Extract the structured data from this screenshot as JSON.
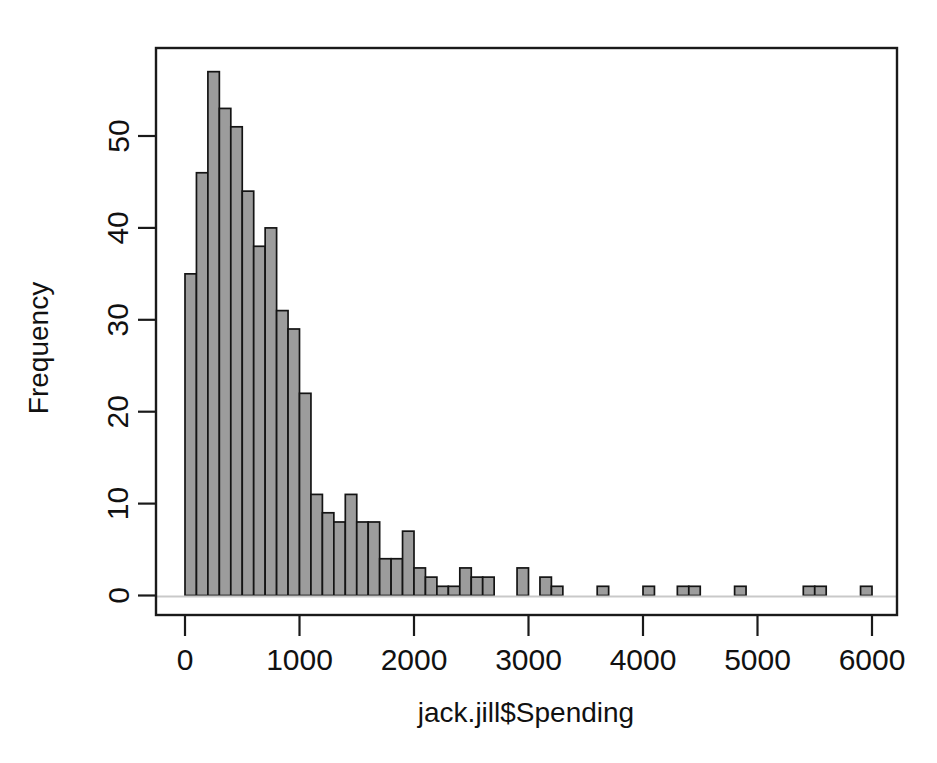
{
  "figure": {
    "type": "histogram-plot",
    "background_color": "#ffffff",
    "bar_fill_color": "#9c9c9c",
    "bar_border_color": "#141414",
    "axis_color": "#1a1a1a"
  },
  "chart_data": {
    "type": "bar",
    "title": "",
    "xlabel": "jack.jill$Spending",
    "ylabel": "Frequency",
    "xlim": [
      -60,
      6320
    ],
    "ylim": [
      0,
      59.5
    ],
    "grid": false,
    "legend": null,
    "bin_width": 100,
    "xticks": [
      0,
      1000,
      2000,
      3000,
      4000,
      5000,
      6000
    ],
    "xtick_labels": [
      "0",
      "1000",
      "2000",
      "3000",
      "4000",
      "5000",
      "6000"
    ],
    "yticks": [
      0,
      10,
      20,
      30,
      40,
      50
    ],
    "ytick_labels": [
      "0",
      "10",
      "20",
      "30",
      "40",
      "50"
    ],
    "bin_starts": [
      0,
      100,
      200,
      300,
      400,
      500,
      600,
      700,
      800,
      900,
      1000,
      1100,
      1200,
      1300,
      1400,
      1500,
      1600,
      1700,
      1800,
      1900,
      2000,
      2100,
      2200,
      2300,
      2400,
      2500,
      2600,
      2700,
      2800,
      2900,
      3000,
      3100,
      3200,
      3300,
      3400,
      3500,
      3600,
      3700,
      3800,
      3900,
      4000,
      4100,
      4200,
      4300,
      4400,
      4500,
      4600,
      4700,
      4800,
      4900,
      5000,
      5100,
      5200,
      5300,
      5400,
      5500,
      5600,
      5700,
      5800,
      5900
    ],
    "categories": [
      "0-100",
      "100-200",
      "200-300",
      "300-400",
      "400-500",
      "500-600",
      "600-700",
      "700-800",
      "800-900",
      "900-1000",
      "1000-1100",
      "1100-1200",
      "1200-1300",
      "1300-1400",
      "1400-1500",
      "1500-1600",
      "1600-1700",
      "1700-1800",
      "1800-1900",
      "1900-2000",
      "2000-2100",
      "2100-2200",
      "2200-2300",
      "2300-2400",
      "2400-2500",
      "2500-2600",
      "2600-2700",
      "2700-2800",
      "2800-2900",
      "2900-3000",
      "3000-3100",
      "3100-3200",
      "3200-3300",
      "3300-3400",
      "3400-3500",
      "3500-3600",
      "3600-3700",
      "3700-3800",
      "3800-3900",
      "3900-4000",
      "4000-4100",
      "4100-4200",
      "4200-4300",
      "4300-4400",
      "4400-4500",
      "4500-4600",
      "4600-4700",
      "4700-4800",
      "4800-4900",
      "4900-5000",
      "5000-5100",
      "5100-5200",
      "5200-5300",
      "5300-5400",
      "5400-5500",
      "5500-5600",
      "5600-5700",
      "5700-5800",
      "5800-5900",
      "5900-6000"
    ],
    "values": [
      35,
      46,
      57,
      53,
      51,
      44,
      38,
      40,
      31,
      29,
      22,
      11,
      9,
      8,
      11,
      8,
      8,
      4,
      4,
      7,
      3,
      2,
      1,
      1,
      3,
      2,
      2,
      0,
      0,
      3,
      0,
      2,
      1,
      0,
      0,
      0,
      1,
      0,
      0,
      0,
      1,
      0,
      0,
      1,
      1,
      0,
      0,
      0,
      1,
      0,
      0,
      0,
      0,
      0,
      1,
      1,
      0,
      0,
      0,
      1
    ]
  },
  "labels": {
    "x_axis_title": "jack.jill$Spending",
    "y_axis_title": "Frequency"
  }
}
